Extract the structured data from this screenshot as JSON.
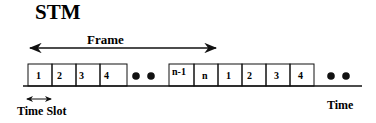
{
  "title": "STM",
  "frame_label": "Frame",
  "time_slot_label": "Time Slot",
  "time_label": "Time",
  "group1": {
    "slots": [
      "1",
      "2",
      "3",
      "4"
    ]
  },
  "group2": {
    "slots": [
      "n-1",
      "n",
      "1",
      "2",
      "3",
      "4"
    ]
  },
  "colors": {
    "line": "#111111",
    "background": "#ffffff"
  }
}
